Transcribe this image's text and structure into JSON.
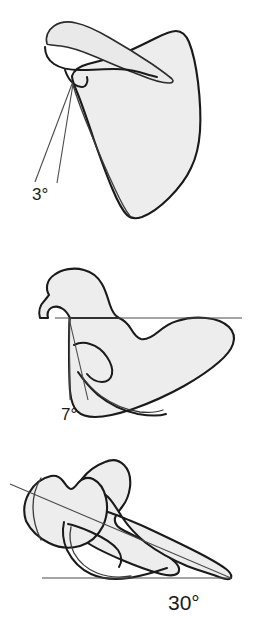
{
  "figure": {
    "background_color": "#ffffff",
    "bone_fill_color": "#ededed",
    "outline_color": "#1a1a1a",
    "reference_line_color": "#4a4a4a"
  },
  "panels": [
    {
      "id": "panel-top",
      "view": "posterior-scapula-view",
      "angle_label": "3°",
      "angle_value": 3,
      "angle_unit": "degrees",
      "reference_lines": 2,
      "reference_line_type": "converging-angle-lines"
    },
    {
      "id": "panel-middle",
      "view": "lateral-scapula-view",
      "angle_label": "7°",
      "angle_value": 7,
      "angle_unit": "degrees",
      "reference_lines": 3,
      "reference_line_type": "horizontal-plus-angle-lines"
    },
    {
      "id": "panel-bottom",
      "view": "superior-axial-scapula-view",
      "angle_label": "30°",
      "angle_value": 30,
      "angle_unit": "degrees",
      "reference_lines": 2,
      "reference_line_type": "horizontal-baseline-plus-oblique"
    }
  ]
}
